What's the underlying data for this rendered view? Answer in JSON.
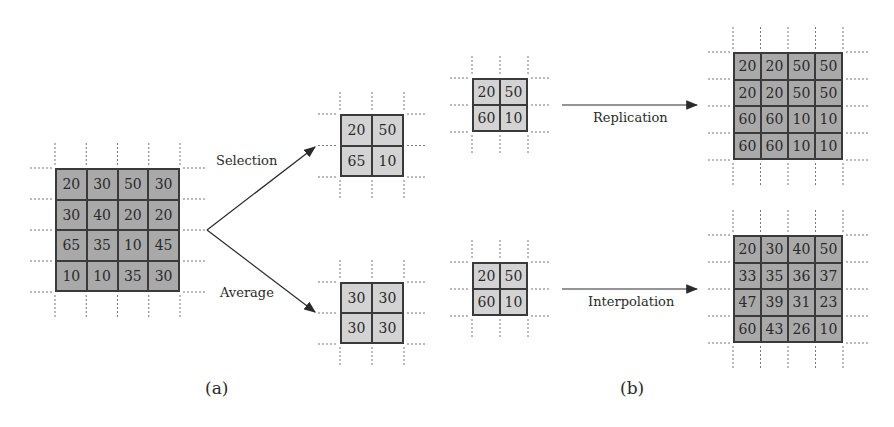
{
  "figure": {
    "panel_a": {
      "caption": "(a)",
      "input_grid": [
        [
          20,
          30,
          50,
          30
        ],
        [
          30,
          40,
          20,
          20
        ],
        [
          65,
          35,
          10,
          45
        ],
        [
          10,
          10,
          35,
          30
        ]
      ],
      "selection": {
        "label": "Selection",
        "grid": [
          [
            20,
            50
          ],
          [
            65,
            10
          ]
        ]
      },
      "average": {
        "label": "Average",
        "grid": [
          [
            30,
            30
          ],
          [
            30,
            30
          ]
        ]
      }
    },
    "panel_b": {
      "caption": "(b)",
      "replication": {
        "label": "Replication",
        "input_grid": [
          [
            20,
            50
          ],
          [
            60,
            10
          ]
        ],
        "output_grid": [
          [
            20,
            20,
            50,
            50
          ],
          [
            20,
            20,
            50,
            50
          ],
          [
            60,
            60,
            10,
            10
          ],
          [
            60,
            60,
            10,
            10
          ]
        ]
      },
      "interpolation": {
        "label": "Interpolation",
        "input_grid": [
          [
            20,
            50
          ],
          [
            60,
            10
          ]
        ],
        "output_grid": [
          [
            20,
            30,
            40,
            50
          ],
          [
            33,
            35,
            36,
            37
          ],
          [
            47,
            39,
            31,
            23
          ],
          [
            60,
            43,
            26,
            10
          ]
        ]
      }
    },
    "colors": {
      "dark_cell": "#a9a9a9",
      "light_cell": "#d3d3d3",
      "line": "#3a3a3a"
    }
  }
}
